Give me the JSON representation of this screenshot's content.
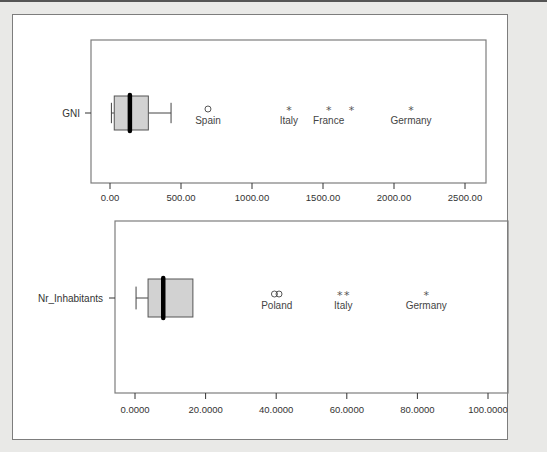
{
  "colors": {
    "page_bg": "#e9e9e7",
    "panel_bg": "#ffffff",
    "frame": "#7d7d7d",
    "box_fill": "#d2d2d2",
    "median": "#000000",
    "text": "#333333"
  },
  "chart_data": [
    {
      "type": "boxplot",
      "title": "",
      "category_label": "GNI",
      "xlabel": "",
      "ylabel": "",
      "xlim": [
        -130,
        2600
      ],
      "ticks": [
        0,
        500,
        1000,
        1500,
        2000,
        2500
      ],
      "tick_labels": [
        "0.00",
        "500.00",
        "1000.00",
        "1500.00",
        "2000.00",
        "2500.00"
      ],
      "box": {
        "whisker_low": 10,
        "q1": 30,
        "median": 140,
        "q3": 270,
        "whisker_high": 430
      },
      "outliers": [
        {
          "value": 690,
          "marker": "circle",
          "label": "Spain"
        },
        {
          "value": 1260,
          "marker": "star",
          "label": "Italy"
        },
        {
          "value": 1540,
          "marker": "star",
          "label": "France"
        },
        {
          "value": 1700,
          "marker": "star",
          "label": ""
        },
        {
          "value": 2120,
          "marker": "star",
          "label": "Germany"
        }
      ],
      "grid": false
    },
    {
      "type": "boxplot",
      "title": "",
      "category_label": "Nr_Inhabitants",
      "xlabel": "",
      "ylabel": "",
      "xlim": [
        -6,
        105
      ],
      "ticks": [
        0,
        20,
        40,
        60,
        80,
        100
      ],
      "tick_labels": [
        "0.0000",
        "20.0000",
        "40.0000",
        "60.0000",
        "80.0000",
        "100.0000"
      ],
      "box": {
        "whisker_low": 0.3,
        "q1": 3.7,
        "median": 8.0,
        "q3": 16.4,
        "whisker_high": 3.7
      },
      "outliers": [
        {
          "value": 39.5,
          "marker": "circle",
          "label": ""
        },
        {
          "value": 40.8,
          "marker": "circle",
          "label": "Poland"
        },
        {
          "value": 58.0,
          "marker": "star",
          "label": ""
        },
        {
          "value": 60.0,
          "marker": "star",
          "label": "Italy"
        },
        {
          "value": 82.5,
          "marker": "star",
          "label": "Germany"
        }
      ],
      "grid": false
    }
  ]
}
